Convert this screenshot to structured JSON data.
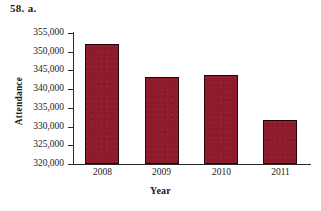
{
  "problem": {
    "label": "58.  a."
  },
  "chart_data": {
    "type": "bar",
    "title": "",
    "xlabel": "Year",
    "ylabel": "Attendance",
    "categories": [
      "2008",
      "2009",
      "2010",
      "2011"
    ],
    "values": [
      352000,
      343300,
      343800,
      331700
    ],
    "ylim": [
      320000,
      355000
    ],
    "ytick_step": 5000,
    "yticks": [
      355000,
      350000,
      345000,
      340000,
      335000,
      330000,
      325000,
      320000
    ],
    "ytick_labels": [
      "355,000",
      "350,000",
      "345,000",
      "340,000",
      "335,000",
      "330,000",
      "325,000",
      "320,000"
    ],
    "grid": false,
    "legend": false,
    "bar_color": "#8e1b2c",
    "bar_edge_color": "#20060b",
    "axis_color": "#2a2a2a",
    "background": "#ffffff"
  }
}
